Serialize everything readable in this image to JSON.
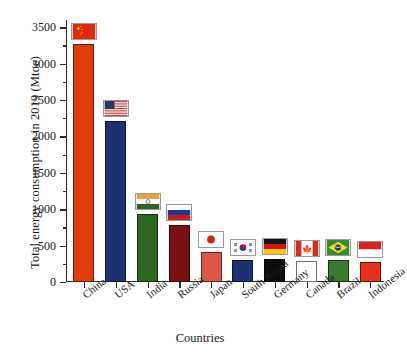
{
  "chart_data": {
    "type": "bar",
    "title": "",
    "xlabel": "Countries",
    "ylabel": "Total energy consumption in 2019 (Mtoe)",
    "ylim": [
      0,
      3600
    ],
    "ytick_labels": [
      "0",
      "500",
      "1000",
      "1500",
      "2000",
      "2500",
      "3000",
      "3500"
    ],
    "ytick_values": [
      0,
      500,
      1000,
      1500,
      2000,
      2500,
      3000,
      3500
    ],
    "minor_ticks": true,
    "grid": false,
    "legend": "none",
    "categories": [
      "China",
      "USA",
      "India",
      "Russia",
      "Japan",
      "South Korea",
      "Germany",
      "Canada",
      "Brazil",
      "Indonesia"
    ],
    "values": [
      3270,
      2213,
      930,
      780,
      415,
      300,
      310,
      290,
      300,
      270
    ],
    "bar_colors": [
      "#e03c0e",
      "#1f3173",
      "#2d6620",
      "#7b1113",
      "#dd5544",
      "#1f3173",
      "#0d0d0d",
      "#ffffff",
      "#3a7a33",
      "#e8301b"
    ],
    "flag_icons": [
      "flag-china-icon",
      "flag-usa-icon",
      "flag-india-icon",
      "flag-russia-icon",
      "flag-japan-icon",
      "flag-south-korea-icon",
      "flag-germany-icon",
      "flag-canada-icon",
      "flag-brazil-icon",
      "flag-indonesia-icon"
    ]
  }
}
